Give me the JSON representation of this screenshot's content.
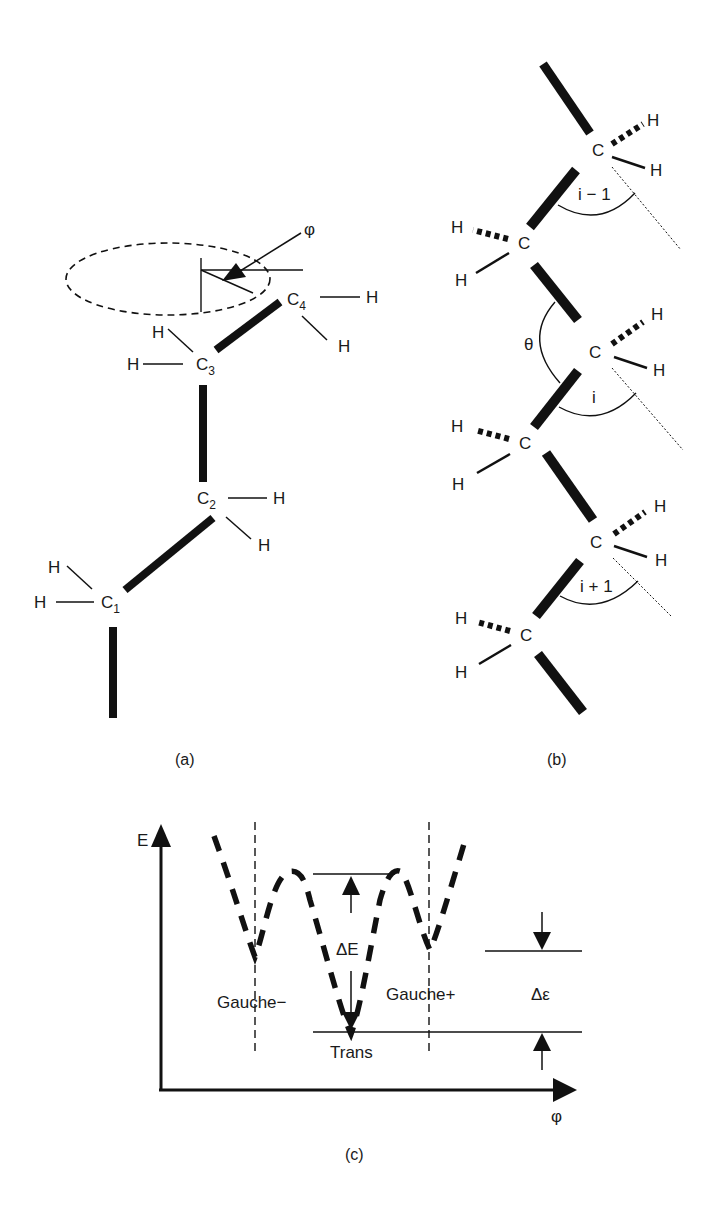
{
  "panel_a": {
    "caption": "(a)",
    "phi_label": "φ",
    "carbons": [
      {
        "name": "C",
        "index": "1"
      },
      {
        "name": "C",
        "index": "2"
      },
      {
        "name": "C",
        "index": "3"
      },
      {
        "name": "C",
        "index": "4"
      }
    ],
    "hydrogen": "H"
  },
  "panel_b": {
    "caption": "(b)",
    "carbon": "C",
    "hydrogen": "H",
    "theta_label": "θ",
    "angle_labels": [
      "i − 1",
      "i",
      "i + 1"
    ]
  },
  "panel_c": {
    "caption": "(c)",
    "y_axis_label": "E",
    "x_axis_label": "φ",
    "delta_E": "ΔE",
    "delta_epsilon": "Δε",
    "gauche_minus": "Gauche−",
    "gauche_plus": "Gauche+",
    "trans": "Trans"
  }
}
